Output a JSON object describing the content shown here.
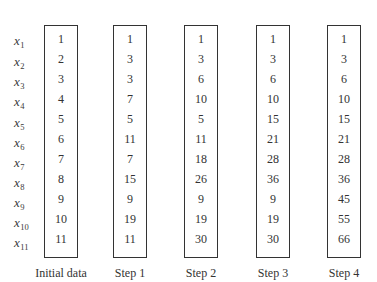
{
  "variables": [
    {
      "base": "x",
      "sub": "1"
    },
    {
      "base": "x",
      "sub": "2"
    },
    {
      "base": "x",
      "sub": "3"
    },
    {
      "base": "x",
      "sub": "4"
    },
    {
      "base": "x",
      "sub": "5"
    },
    {
      "base": "x",
      "sub": "6"
    },
    {
      "base": "x",
      "sub": "7"
    },
    {
      "base": "x",
      "sub": "8"
    },
    {
      "base": "x",
      "sub": "9"
    },
    {
      "base": "x",
      "sub": "10"
    },
    {
      "base": "x",
      "sub": "11"
    }
  ],
  "columns": [
    {
      "caption": "Initial data",
      "values": [
        "1",
        "2",
        "3",
        "4",
        "5",
        "6",
        "7",
        "8",
        "9",
        "10",
        "11"
      ]
    },
    {
      "caption": "Step 1",
      "values": [
        "1",
        "3",
        "3",
        "7",
        "5",
        "11",
        "7",
        "15",
        "9",
        "19",
        "11"
      ]
    },
    {
      "caption": "Step 2",
      "values": [
        "1",
        "3",
        "6",
        "10",
        "5",
        "11",
        "18",
        "26",
        "9",
        "19",
        "30"
      ]
    },
    {
      "caption": "Step 3",
      "values": [
        "1",
        "3",
        "6",
        "10",
        "15",
        "21",
        "28",
        "36",
        "9",
        "19",
        "30"
      ]
    },
    {
      "caption": "Step 4",
      "values": [
        "1",
        "3",
        "6",
        "10",
        "15",
        "21",
        "28",
        "36",
        "45",
        "55",
        "66"
      ]
    }
  ]
}
